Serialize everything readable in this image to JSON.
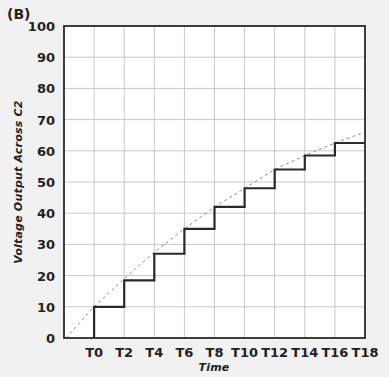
{
  "panel_label": "(B)",
  "chart_data": {
    "type": "line",
    "title": "",
    "xlabel": "Time",
    "ylabel": "Voltage Output Across C2",
    "ylim": [
      0,
      100
    ],
    "yticks": [
      0,
      10,
      20,
      30,
      40,
      50,
      60,
      70,
      80,
      90,
      100
    ],
    "xticks": [
      "T0",
      "T2",
      "T4",
      "T6",
      "T8",
      "T10",
      "T12",
      "T14",
      "T16",
      "T18"
    ],
    "grid": true,
    "series": [
      {
        "name": "Step voltage (charge pump)",
        "style": "solid-step",
        "x": [
          "T0",
          "T2",
          "T4",
          "T6",
          "T8",
          "T10",
          "T12",
          "T14",
          "T16",
          "T18"
        ],
        "values": [
          10,
          18.5,
          27,
          35,
          42,
          48,
          54,
          58.5,
          62.5,
          62.5
        ]
      },
      {
        "name": "Exponential envelope",
        "style": "dashed",
        "x": [
          "start",
          "T0",
          "T2",
          "T4",
          "T6",
          "T8",
          "T10",
          "T12",
          "T14",
          "T16",
          "T18"
        ],
        "values": [
          0,
          10,
          19,
          27.5,
          35,
          42,
          48,
          54,
          58.5,
          62.5,
          66
        ]
      }
    ]
  }
}
